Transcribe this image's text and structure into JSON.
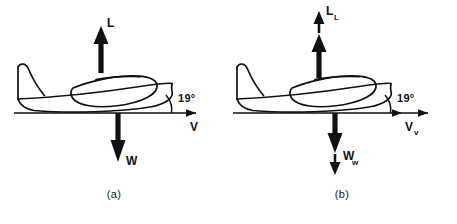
{
  "figure": {
    "background_color": "#ffffff",
    "ink_color": "#111111",
    "panels": [
      {
        "id": "a",
        "caption": "(a)",
        "angle": {
          "value": "19",
          "unit": "°",
          "text": "19°"
        },
        "vectors": [
          {
            "name": "lift",
            "label": "L",
            "subscript": "",
            "direction": "up",
            "count": 1
          },
          {
            "name": "weight",
            "label": "W",
            "subscript": "",
            "direction": "down",
            "count": 1
          },
          {
            "name": "velocity",
            "label": "V",
            "subscript": "",
            "direction": "right",
            "count": 1
          }
        ],
        "aircraft": "side-view-airplane-silhouette"
      },
      {
        "id": "b",
        "caption": "(b)",
        "angle": {
          "value": "19",
          "unit": "°",
          "text": "19°"
        },
        "vectors": [
          {
            "name": "lift",
            "label": "L",
            "subscript": "L",
            "direction": "up",
            "count": 2
          },
          {
            "name": "weight",
            "label": "W",
            "subscript": "w",
            "direction": "down",
            "count": 2
          },
          {
            "name": "velocity",
            "label": "V",
            "subscript": "v",
            "direction": "right",
            "count": 2
          }
        ],
        "aircraft": "side-view-airplane-silhouette"
      }
    ]
  }
}
